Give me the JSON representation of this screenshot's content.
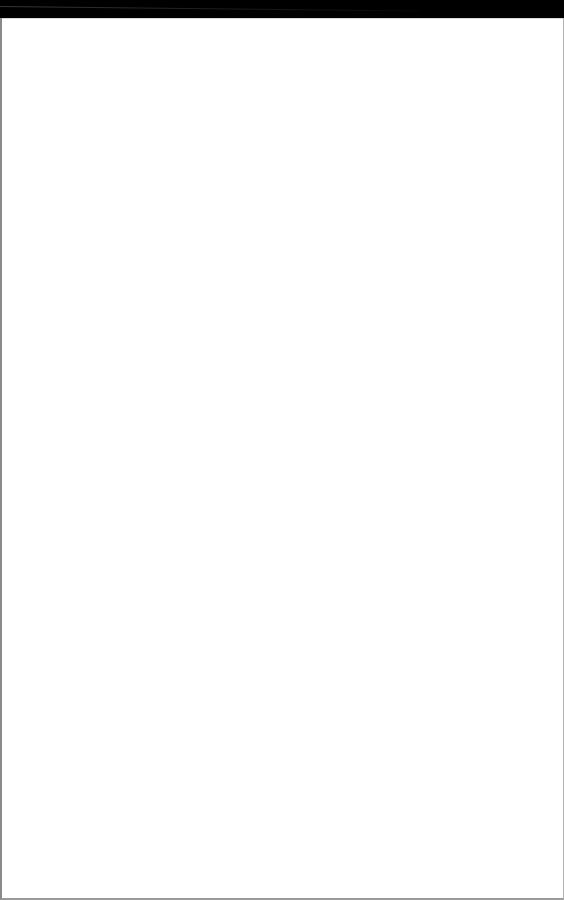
{
  "page": {
    "background_color": "#ffffff",
    "top_band_color": "#000000",
    "edge_color": "#8a8a8a"
  }
}
